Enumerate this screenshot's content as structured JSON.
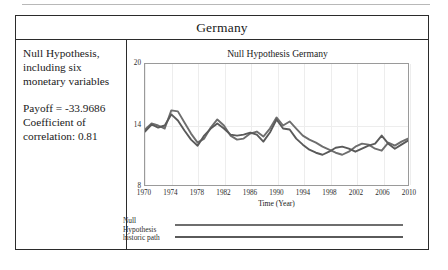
{
  "figure": {
    "header_title": "Germany",
    "left_panel": {
      "description": "Null Hypothesis, including six monetary variables",
      "payoff": "Payoff = -33.9686",
      "correlation": "Coefficient of correlation: 0.81"
    }
  },
  "chart_data": {
    "type": "line",
    "title": "Null Hypothesis Germany",
    "xlabel": "Time (Year)",
    "ylabel": "",
    "xlim": [
      1970,
      2010
    ],
    "ylim": [
      8,
      20
    ],
    "yticks": [
      20,
      14,
      8
    ],
    "xticks": [
      1970,
      1974,
      1978,
      1982,
      1986,
      1990,
      1994,
      1998,
      2002,
      2006,
      2010
    ],
    "grid": true,
    "legend_position": "below",
    "colors": {
      "null_hypothesis": "#6e6e6e",
      "historic_path": "#5a5a5a",
      "plot_border": "#9a9a9a",
      "grid": "#ededed",
      "frame": "#2b2b2b"
    },
    "x": [
      1970,
      1971,
      1972,
      1973,
      1974,
      1975,
      1976,
      1977,
      1978,
      1979,
      1980,
      1981,
      1982,
      1983,
      1984,
      1985,
      1986,
      1987,
      1988,
      1989,
      1990,
      1991,
      1992,
      1993,
      1994,
      1995,
      1996,
      1997,
      1998,
      1999,
      2000,
      2001,
      2002,
      2003,
      2004,
      2005,
      2006,
      2007,
      2008,
      2009,
      2010
    ],
    "series": [
      {
        "name": "Null Hypothesis",
        "values": [
          13.5,
          14.1,
          13.9,
          13.6,
          15.4,
          15.3,
          14.2,
          13.1,
          12.2,
          12.6,
          13.7,
          14.5,
          13.9,
          12.9,
          12.5,
          12.6,
          13.1,
          13.3,
          12.8,
          13.6,
          14.7,
          13.9,
          14.3,
          13.6,
          12.9,
          12.5,
          12.2,
          11.8,
          11.5,
          11.2,
          11.0,
          11.3,
          11.8,
          12.1,
          12.0,
          11.6,
          11.4,
          12.2,
          11.9,
          12.3,
          12.6
        ]
      },
      {
        "name": "historic path",
        "values": [
          13.3,
          14.0,
          13.7,
          13.9,
          15.0,
          14.4,
          13.4,
          12.5,
          11.9,
          12.9,
          13.6,
          14.1,
          13.6,
          13.0,
          12.9,
          13.0,
          13.2,
          13.0,
          12.3,
          13.2,
          14.5,
          13.6,
          13.5,
          12.6,
          12.0,
          11.5,
          11.2,
          11.0,
          11.3,
          11.7,
          11.8,
          11.6,
          11.3,
          11.6,
          11.9,
          12.1,
          12.9,
          12.1,
          11.6,
          12.0,
          12.4
        ]
      }
    ]
  }
}
